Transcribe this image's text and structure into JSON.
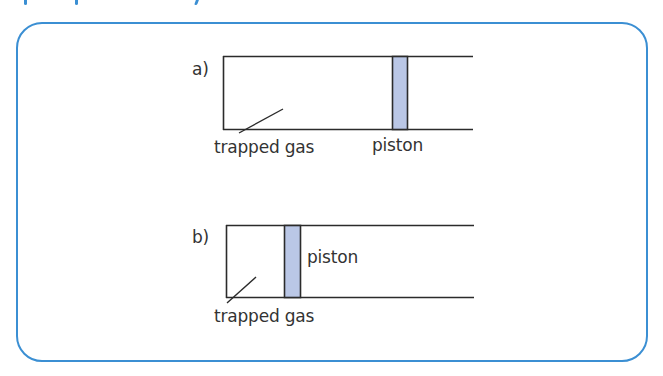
{
  "header": {
    "title_visible": false,
    "note": ""
  },
  "colors": {
    "frame_border": "#3b8fd3",
    "line": "#2b2b2b",
    "piston_fill": "#bac7e6",
    "text": "#333333"
  },
  "figures": [
    {
      "id": "a",
      "tag": "a)",
      "labels": {
        "gas": "trapped gas",
        "piston": "piston"
      }
    },
    {
      "id": "b",
      "tag": "b)",
      "labels": {
        "gas": "trapped gas",
        "piston": "piston"
      }
    }
  ]
}
